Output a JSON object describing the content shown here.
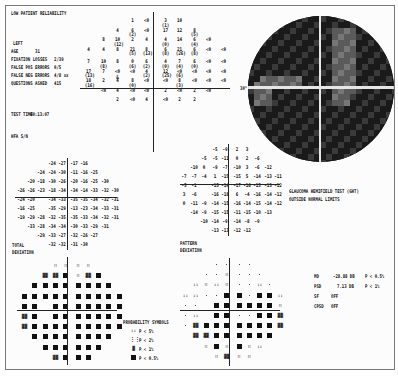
{
  "header": {
    "reliability_warning": "LOW PATIENT RELIABILITY"
  },
  "patient": {
    "eye": "LEFT",
    "age_label": "AGE",
    "age_value": "31",
    "fixation_losses_label": "FIXATION LOSSES",
    "fixation_losses_value": "2/39",
    "false_pos_label": "FALSE POS ERRORS",
    "false_pos_value": "0/5",
    "false_neg_label": "FALSE NEG ERRORS",
    "false_neg_value": "4/8 xx",
    "questions_label": "QUESTIONS ASKED",
    "questions_value": "415",
    "test_time_label": "TEST TIME",
    "test_time_value": "00:13:07",
    "hfa_label": "HFA S/N"
  },
  "threshold_map": {
    "rows": [
      [
        "",
        "",
        "",
        "1",
        "<0",
        "3\n(1)",
        "10",
        "",
        "",
        ""
      ],
      [
        "",
        "",
        "4",
        "6\n(2)",
        "<0",
        "17",
        "12",
        "8\n(5)",
        "",
        ""
      ],
      [
        "",
        "8",
        "10\n(12)",
        "2",
        "4",
        "4\n(0)",
        "14",
        "6\n(4)",
        "<0",
        ""
      ],
      [
        "4",
        "4",
        "8",
        "21\n(5)",
        "8\n(13)",
        "6\n(8)",
        "21\n(26)",
        "6\n(8)",
        "<0",
        "<0"
      ],
      [
        "7",
        "10\n(8)",
        "8",
        "0\n(6)",
        "6\n(2)",
        "4\n(0)",
        "7\n(4)",
        "6\n(0)",
        "<0",
        "<0"
      ],
      [
        "17\n(13)",
        "7",
        "<0 &",
        "<0",
        "4\n(2)",
        "12\n(25)",
        "<0\n(6)",
        "<0",
        "<0",
        "<0"
      ],
      [
        "18\n(16)",
        "2",
        "4",
        "8\n(0)",
        "<0",
        "<0",
        "8\n(3)",
        "<0",
        "<0",
        "<0"
      ],
      [
        "",
        "<0",
        "4",
        "<0",
        "<0",
        "2",
        "<0",
        "2",
        "<0",
        ""
      ],
      [
        "",
        "",
        "2",
        "<0",
        "4",
        "<0",
        "2",
        "2",
        "",
        ""
      ]
    ]
  },
  "greyscale": {
    "degree_label": "30°"
  },
  "total_deviation": {
    "label_line1": "TOTAL",
    "label_line2": "DEVIATION",
    "rows": [
      [
        "",
        "",
        "",
        "-24",
        "-27",
        "-17",
        "-16",
        "",
        "",
        ""
      ],
      [
        "",
        "",
        "-24",
        "-24",
        "-30",
        "-11",
        "-16",
        "-25",
        "",
        ""
      ],
      [
        "",
        "-20",
        "-18",
        "-30",
        "-26",
        "-20",
        "-16",
        "-25",
        "-30",
        ""
      ],
      [
        "-26",
        "-26",
        "-23",
        "-18",
        "-34",
        "-34",
        "-14",
        "-33",
        "-32",
        "-30"
      ],
      [
        "-24",
        "-20",
        "",
        "-34",
        "-33",
        "-35",
        "-35",
        "-34",
        "-32",
        "-31"
      ],
      [
        "-16",
        "-25",
        "",
        "-35",
        "-29",
        "-13",
        "-23",
        "-34",
        "-33",
        "-31"
      ],
      [
        "-19",
        "-29",
        "-28",
        "-32",
        "-35",
        "-35",
        "-33",
        "-34",
        "-32",
        "-31"
      ],
      [
        "",
        "-33",
        "-28",
        "-34",
        "-34",
        "-30",
        "-33",
        "-29",
        "-31",
        ""
      ],
      [
        "",
        "",
        "-29",
        "-33",
        "-27",
        "-32",
        "-26",
        "-27",
        "",
        ""
      ],
      [
        "",
        "",
        "",
        "-32",
        "-32",
        "-31",
        "-30",
        "",
        "",
        ""
      ]
    ]
  },
  "pattern_deviation": {
    "label_line1": "PATTERN",
    "label_line2": "DEVIATION",
    "rows": [
      [
        "",
        "",
        "",
        "-5",
        "-9",
        "2",
        "3",
        "",
        "",
        ""
      ],
      [
        "",
        "",
        "-5",
        "-5",
        "-11",
        "0",
        "2",
        "-6",
        "",
        ""
      ],
      [
        "",
        "-10",
        "0",
        "-9",
        "-7",
        "-10",
        "3",
        "-6",
        "-12",
        ""
      ],
      [
        "-7",
        "-7",
        "-4",
        "1",
        "-15",
        "-15",
        "5",
        "-14",
        "-13",
        "-11"
      ],
      [
        "-5",
        "-1",
        "",
        "-15",
        "-14",
        "-17",
        "-16",
        "-15",
        "-13",
        "-12"
      ],
      [
        "3",
        "-6",
        "",
        "-16",
        "-18",
        "6",
        "-4",
        "-16",
        "-14",
        "-12"
      ],
      [
        "0",
        "-11",
        "-9",
        "-14",
        "-15",
        "-16",
        "-14",
        "-15",
        "-14",
        "-12"
      ],
      [
        "",
        "-14",
        "-9",
        "-15",
        "-15",
        "-11",
        "-15",
        "-10",
        "-13",
        ""
      ],
      [
        "",
        "",
        "-10",
        "-14",
        "-9",
        "-14",
        "-8",
        "-9",
        "",
        ""
      ],
      [
        "",
        "",
        "",
        "-13",
        "-13",
        "-12",
        "-12",
        "",
        "",
        ""
      ]
    ]
  },
  "ght": {
    "title": "GLAUCOMA HEMIFIELD TEST (GHT)",
    "result": "OUTSIDE NORMAL LIMITS"
  },
  "indices": {
    "md_label": "MD",
    "md_value": "-28.88 DB",
    "md_p": "P < 0.5%",
    "psd_label": "PSD",
    "psd_value": "7.13 DB",
    "psd_p": "P < 1%",
    "sf_label": "SF",
    "sf_value": "OFF",
    "cpsd_label": "CPSD",
    "cpsd_value": "OFF"
  },
  "legend": {
    "title": "PROBABILITY SYMBOLS",
    "items": [
      {
        "symbol": "::",
        "label": "P <  5%"
      },
      {
        "symbol": "⋮⋮",
        "label": "P <  2%"
      },
      {
        "symbol": "▓",
        "label": "P <  1%"
      },
      {
        "symbol": "■",
        "label": "P < 0.5%"
      }
    ]
  },
  "total_prob_map": {
    "rows": [
      [
        "",
        "",
        "",
        "b",
        "b",
        "b",
        "b",
        "",
        "",
        ""
      ],
      [
        "",
        "",
        "c",
        "c",
        "s",
        "b",
        "c",
        "s",
        "",
        ""
      ],
      [
        "",
        "s",
        "s",
        "s",
        "s",
        "s",
        "s",
        "s",
        "s",
        ""
      ],
      [
        "s",
        "s",
        "s",
        "s",
        "s",
        "s",
        "s",
        "s",
        "s",
        "s"
      ],
      [
        "s",
        "s",
        "",
        "s",
        "s",
        "s",
        "s",
        "s",
        "s",
        "s"
      ],
      [
        "c",
        "s",
        "",
        "s",
        "s",
        "s",
        "s",
        "s",
        "s",
        "s"
      ],
      [
        "c",
        "s",
        "s",
        "s",
        "s",
        "s",
        "s",
        "s",
        "s",
        "s"
      ],
      [
        "",
        "s",
        "s",
        "s",
        "s",
        "s",
        "s",
        "s",
        "s",
        ""
      ],
      [
        "",
        "",
        "s",
        "s",
        "s",
        "s",
        "s",
        "s",
        "",
        ""
      ],
      [
        "",
        "",
        "",
        "c",
        "s",
        "s",
        "s",
        "",
        "",
        ""
      ]
    ]
  },
  "pattern_prob_map": {
    "rows": [
      [
        "",
        "",
        "",
        ".",
        ".",
        ".",
        ".",
        "",
        "",
        ""
      ],
      [
        "",
        "",
        ".",
        ".",
        "b",
        ".",
        ".",
        ".",
        "",
        ""
      ],
      [
        "",
        "a",
        "b",
        "a",
        "b",
        ".",
        ".",
        "a",
        ".",
        ""
      ],
      [
        "a",
        "a",
        ".",
        ".",
        "s",
        "s",
        ".",
        "s",
        "s",
        "a"
      ],
      [
        ".",
        ".",
        "",
        "s",
        "s",
        "s",
        "s",
        "s",
        "s",
        "b"
      ],
      [
        ".",
        "a",
        "",
        "s",
        "s",
        ".",
        ".",
        "s",
        "s",
        "c"
      ],
      [
        ".",
        "c",
        "s",
        "s",
        "s",
        "s",
        "s",
        "s",
        "s",
        "c"
      ],
      [
        "",
        "c",
        "c",
        "s",
        "s",
        "s",
        "s",
        "s",
        "s",
        ""
      ],
      [
        "",
        "",
        "b",
        "s",
        "b",
        "s",
        "b",
        "a",
        "",
        ""
      ],
      [
        "",
        "",
        "",
        "b",
        "c",
        "b",
        "b",
        "",
        "",
        ""
      ]
    ]
  }
}
